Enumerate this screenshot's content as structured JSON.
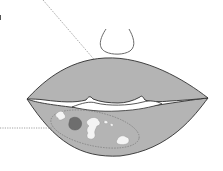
{
  "diagram": {
    "colors": {
      "background": "#ffffff",
      "lip_fill": "#b4b4b4",
      "lip_outline": "#2e2e2e",
      "nose_outline": "#6a6a6a",
      "mouth_opening": "#ffffff",
      "lesion_white": "#f4f4f4",
      "lesion_dark": "#6e6e6e",
      "leader_line": "#8a8a8a",
      "region_outline": "#7a7a7a"
    },
    "elements": [
      {
        "id": "nose",
        "description": "nose outline"
      },
      {
        "id": "upper-lip",
        "description": "upper lip"
      },
      {
        "id": "lower-lip",
        "description": "lower lip"
      },
      {
        "id": "mouth-opening",
        "description": "gap between lips"
      },
      {
        "id": "lesion-region",
        "description": "dashed oval region on lower lip"
      },
      {
        "id": "white-patches",
        "description": "white lesion patches"
      },
      {
        "id": "dark-patch",
        "description": "dark red lesion patch"
      }
    ],
    "leader_lines": [
      {
        "target": "upper-lip",
        "from": [
          43,
          0
        ],
        "to": [
          110,
          77
        ]
      },
      {
        "target": "lesion-region",
        "from": [
          0,
          128
        ],
        "to": [
          52,
          128
        ]
      }
    ]
  }
}
